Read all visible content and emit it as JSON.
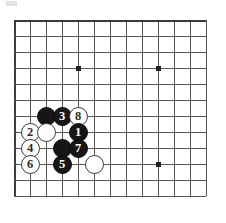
{
  "page": {
    "background_color": "#ffffff"
  },
  "board": {
    "type": "go-board-partial",
    "description": "Top-left corner of a Go board showing a joseki sequence",
    "line_color": "#555555",
    "edge_color": "#3a3a3a",
    "star_point_color": "#222222",
    "origin_x": 14,
    "origin_y": 20,
    "spacing": 16,
    "columns": 13,
    "rows": 12,
    "star_points": [
      {
        "col": 4,
        "row": 3
      },
      {
        "col": 9,
        "row": 3
      },
      {
        "col": 9,
        "row": 9
      }
    ],
    "edges": {
      "left": true,
      "top": true,
      "right": false,
      "bottom": true
    }
  },
  "stones": [
    {
      "name": "black-stone-unnumbered-a",
      "color": "black",
      "label": "",
      "col": 2,
      "row": 6
    },
    {
      "name": "black-stone-3",
      "color": "black",
      "label": "3",
      "col": 3,
      "row": 6
    },
    {
      "name": "white-stone-8",
      "color": "white",
      "label": "8",
      "col": 4,
      "row": 6
    },
    {
      "name": "white-stone-2",
      "color": "white",
      "label": "2",
      "col": 1,
      "row": 7
    },
    {
      "name": "white-stone-unnumbered-b",
      "color": "white",
      "label": "",
      "col": 2,
      "row": 7
    },
    {
      "name": "black-stone-1",
      "color": "black",
      "label": "1",
      "col": 4,
      "row": 7
    },
    {
      "name": "white-stone-4",
      "color": "white",
      "label": "4",
      "col": 1,
      "row": 8
    },
    {
      "name": "black-stone-unnumbered-c",
      "color": "black",
      "label": "",
      "col": 3,
      "row": 8
    },
    {
      "name": "black-stone-7",
      "color": "black",
      "label": "7",
      "col": 4,
      "row": 8
    },
    {
      "name": "white-stone-6",
      "color": "white",
      "label": "6",
      "col": 1,
      "row": 9
    },
    {
      "name": "black-stone-5",
      "color": "black",
      "label": "5",
      "col": 3,
      "row": 9
    },
    {
      "name": "white-stone-unnumbered-d",
      "color": "white",
      "label": "",
      "col": 5,
      "row": 9
    }
  ]
}
